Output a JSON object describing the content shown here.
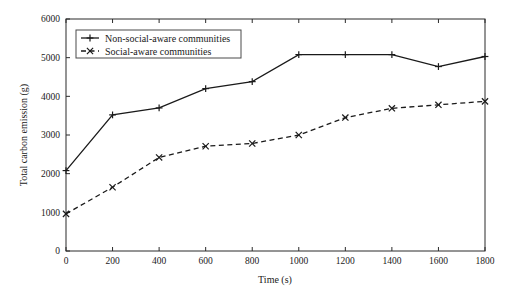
{
  "chart_data": {
    "type": "line",
    "title": "",
    "xlabel": "Time (s)",
    "ylabel": "Total carbon emission (g)",
    "xlim": [
      0,
      1800
    ],
    "ylim": [
      0,
      6000
    ],
    "xticks": [
      0,
      200,
      400,
      600,
      800,
      1000,
      1200,
      1400,
      1600,
      1800
    ],
    "yticks": [
      0,
      1000,
      2000,
      3000,
      4000,
      5000,
      6000
    ],
    "x": [
      0,
      200,
      400,
      600,
      800,
      1000,
      1200,
      1400,
      1600,
      1800
    ],
    "grid": false,
    "legend_position": "upper left",
    "series": [
      {
        "name": "Non-social-aware communities",
        "marker": "plus",
        "linestyle": "solid",
        "color": "#1a1a1a",
        "values": [
          2080,
          3520,
          3700,
          4200,
          4380,
          5080,
          5080,
          5080,
          4770,
          5030
        ]
      },
      {
        "name": "Social-aware communities",
        "marker": "x",
        "linestyle": "dashed",
        "color": "#1a1a1a",
        "values": [
          960,
          1650,
          2420,
          2710,
          2780,
          3000,
          3450,
          3690,
          3780,
          3870
        ]
      }
    ]
  },
  "axis": {
    "x_tick_labels": [
      "0",
      "200",
      "400",
      "600",
      "800",
      "1000",
      "1200",
      "1400",
      "1600",
      "1800"
    ],
    "y_tick_labels": [
      "0",
      "1000",
      "2000",
      "3000",
      "4000",
      "5000",
      "6000"
    ],
    "x_title": "Time (s)",
    "y_title": "Total carbon emission (g)"
  },
  "legend": {
    "entries": [
      {
        "label": "Non-social-aware communities",
        "style": "solid-plus"
      },
      {
        "label": "Social-aware communities",
        "style": "dashed-x"
      }
    ]
  }
}
